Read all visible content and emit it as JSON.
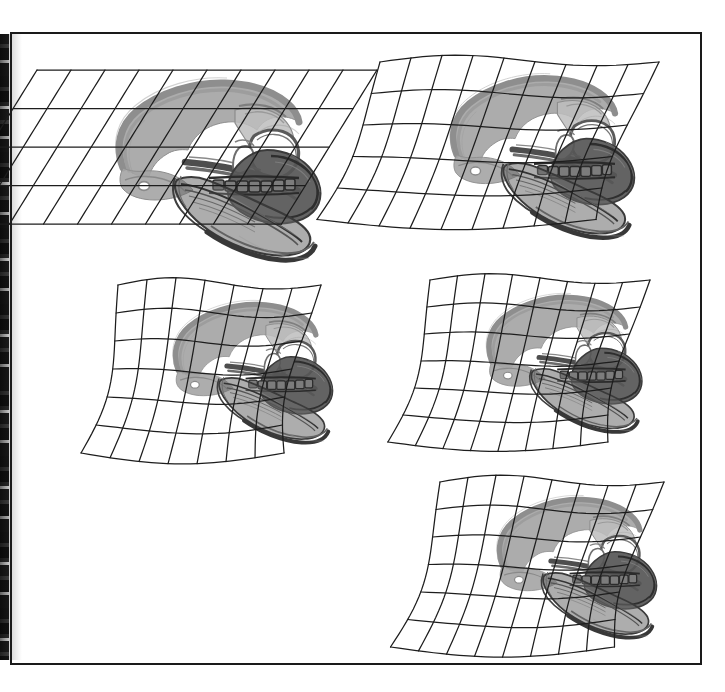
{
  "figure": {
    "kind": "morphometric-transformation-grid-plate",
    "domain_note": "Comparative skull outlines drawn on deformed Cartesian grids (D'Arcy-Thompson style transformation series)",
    "panel_count": 5,
    "background_color": "#ffffff",
    "frame": {
      "stroke_color": "#1a1a1a",
      "stroke_width": 2,
      "x": 11,
      "y": 33,
      "width": 690,
      "height": 631
    },
    "ink": {
      "grid_stroke": "#1d1d1d",
      "grid_stroke_width": 1.25,
      "outline_light_gray": "#9a9a9a",
      "outline_mid_gray": "#6e6e6e",
      "outline_dark_gray": "#4a4a4a",
      "outline_near_black": "#2a2a2a",
      "fill_light": "#b4b4b4",
      "fill_dark": "#5e5e5e"
    },
    "scan_artifact": {
      "present": true,
      "edge": "left",
      "description": "dark mottled book-gutter band",
      "width": 9
    },
    "panels": [
      {
        "id": "panel-1",
        "position": "top-left",
        "grid_type": "sheared-affine",
        "grid_columns": 10,
        "grid_rows": 4,
        "origin_x": 37,
        "origin_y": 70,
        "cell_w": 34.0,
        "cell_h": 38.5,
        "shear_x": -0.62,
        "warp_amplitude_x": 0.0,
        "warp_amplitude_y": 0.0,
        "rotation_deg": 0,
        "skull_scale": 1.0,
        "skull_offset_x": 52,
        "skull_offset_y": 6
      },
      {
        "id": "panel-2",
        "position": "top-right",
        "grid_type": "curvilinear-warped",
        "grid_columns": 9,
        "grid_rows": 5,
        "origin_x": 380,
        "origin_y": 62,
        "cell_w": 31.0,
        "cell_h": 31.5,
        "shear_x": -0.4,
        "warp_amplitude_x": 9.0,
        "warp_amplitude_y": 13.0,
        "rotation_deg": 0,
        "skull_scale": 0.9,
        "skull_offset_x": 46,
        "skull_offset_y": 10
      },
      {
        "id": "panel-3",
        "position": "middle-left",
        "grid_type": "curvilinear-warped",
        "grid_columns": 7,
        "grid_rows": 6,
        "origin_x": 118,
        "origin_y": 285,
        "cell_w": 29.0,
        "cell_h": 28.0,
        "shear_x": -0.22,
        "warp_amplitude_x": 12.0,
        "warp_amplitude_y": 14.0,
        "rotation_deg": 0,
        "skull_scale": 0.78,
        "skull_offset_x": 34,
        "skull_offset_y": 14
      },
      {
        "id": "panel-4",
        "position": "middle-right",
        "grid_type": "curvilinear-warped",
        "grid_columns": 8,
        "grid_rows": 6,
        "origin_x": 430,
        "origin_y": 280,
        "cell_w": 27.5,
        "cell_h": 27.0,
        "shear_x": -0.26,
        "warp_amplitude_x": 11.0,
        "warp_amplitude_y": 12.0,
        "rotation_deg": 0,
        "skull_scale": 0.76,
        "skull_offset_x": 36,
        "skull_offset_y": 12
      },
      {
        "id": "panel-5",
        "position": "bottom-right",
        "grid_type": "curvilinear-warped",
        "grid_columns": 8,
        "grid_rows": 6,
        "origin_x": 440,
        "origin_y": 482,
        "cell_w": 28.0,
        "cell_h": 27.5,
        "shear_x": -0.3,
        "warp_amplitude_x": 12.0,
        "warp_amplitude_y": 13.0,
        "rotation_deg": 0,
        "skull_scale": 0.78,
        "skull_offset_x": 36,
        "skull_offset_y": 12
      }
    ],
    "skull_template": {
      "description": "lateral view of a hominid-like skull with heavy cranial vault outline, orbit, zygomatic arch, nasal aperture, maxillary tooth row and mandible",
      "features": [
        "cranial-vault",
        "frontal-bone",
        "orbit",
        "nasal-aperture",
        "zygomatic-arch",
        "maxilla",
        "tooth-row",
        "mandible",
        "occipital-region"
      ]
    }
  }
}
